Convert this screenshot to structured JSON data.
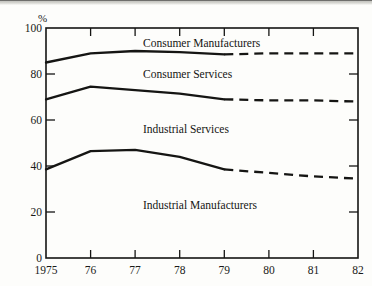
{
  "figure": {
    "unit_label": "%",
    "background_color": "#fdfdfb",
    "ink_color": "#151513"
  },
  "axes": {
    "y_ticks": [
      "0",
      "20",
      "40",
      "60",
      "80",
      "100"
    ],
    "x_ticks": [
      "1975",
      "76",
      "77",
      "78",
      "79",
      "80",
      "81",
      "82"
    ]
  },
  "band_labels": {
    "consumer_manufacturers": "Consumer Manufacturers",
    "consumer_services": "Consumer Services",
    "industrial_services": "Industrial Services",
    "industrial_manufacturers": "Industrial Manufacturers"
  },
  "chart_data": {
    "type": "line",
    "title": "",
    "xlabel": "",
    "ylabel": "%",
    "ylim": [
      0,
      100
    ],
    "xlim": [
      1975,
      1982
    ],
    "grid": false,
    "legend": "inline-band-labels",
    "y_ticks": [
      0,
      20,
      40,
      60,
      80,
      100
    ],
    "x": [
      1975,
      1976,
      1977,
      1978,
      1979,
      1980,
      1981,
      1982
    ],
    "x_tick_labels": [
      "1975",
      "76",
      "77",
      "78",
      "79",
      "80",
      "81",
      "82"
    ],
    "actual_through": 1979,
    "projection_from": 1979,
    "note": "Cumulative share boundaries; bands between lines are labeled segments. Solid = actual 1975-79, dashed = projected 1979-82.",
    "series": [
      {
        "name": "Consumer Manufacturers boundary",
        "band_label": "Consumer Manufacturers",
        "band_position": "above-line",
        "values": [
          85,
          89,
          90,
          89.5,
          88.5,
          89,
          89,
          89
        ],
        "style": "solid-then-dashed"
      },
      {
        "name": "Consumer Services boundary",
        "band_label": "Consumer Services",
        "band_position": "above-line",
        "values": [
          69,
          74.5,
          73,
          71.5,
          69,
          68.5,
          68.5,
          68
        ],
        "style": "solid-then-dashed"
      },
      {
        "name": "Industrial Services boundary",
        "band_label": "Industrial Services",
        "band_position": "above-line",
        "values": [
          38.5,
          46.5,
          47,
          44,
          38.5,
          37,
          35.5,
          34.5
        ],
        "style": "solid-then-dashed"
      }
    ],
    "bands": [
      {
        "label": "Consumer Manufacturers",
        "between": [
          "top-of-chart",
          "Consumer Manufacturers boundary"
        ]
      },
      {
        "label": "Consumer Services",
        "between": [
          "Consumer Manufacturers boundary",
          "Consumer Services boundary"
        ]
      },
      {
        "label": "Industrial Services",
        "between": [
          "Consumer Services boundary",
          "Industrial Services boundary"
        ]
      },
      {
        "label": "Industrial Manufacturers",
        "between": [
          "Industrial Services boundary",
          "baseline-0"
        ]
      }
    ]
  }
}
